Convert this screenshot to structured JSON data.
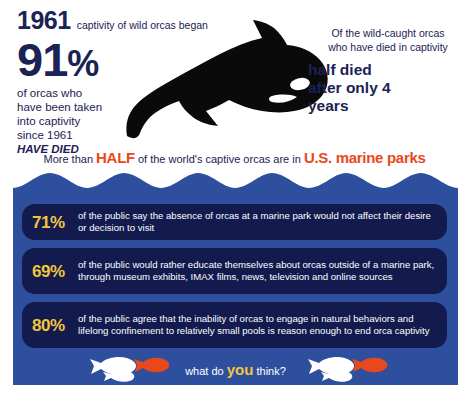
{
  "top": {
    "year": "1961",
    "year_caption": "captivity of wild orcas began",
    "percent_number": "91",
    "percent_symbol": "%",
    "body_line1": "of orcas who",
    "body_line2": "have been taken",
    "body_line3": "into captivity",
    "body_line4": "since 1961",
    "body_emphasis": "HAVE DIED",
    "right_lead_line1": "Of the wild-caught orcas",
    "right_lead_line2": "who have died in captivity",
    "right_big_line1": "half died",
    "right_big_line2": "after only 4",
    "right_big_line3": "years",
    "orca_icon": "orca-silhouette-icon"
  },
  "half_line": {
    "prefix": "More than ",
    "emphasis": "HALF",
    "middle": " of the world's captive orcas are in ",
    "emphasis2": "U.S. marine parks"
  },
  "panel": {
    "stats": [
      {
        "percent": "71%",
        "text": "of the public say the absence of orcas at a marine park would not affect their desire or decision to visit"
      },
      {
        "percent": "69%",
        "text": "of the public would rather educate themselves about orcas outside of a marine park, through museum exhibits, IMAX films, news, television and online sources"
      },
      {
        "percent": "80%",
        "text": "of the public agree that the inability of orcas to engage in natural behaviors and lifelong confinement to relatively small pools is reason enough to end orca captivity"
      }
    ],
    "footer": {
      "prefix": "what do ",
      "emphasis": "you",
      "suffix": " think?",
      "fish_icon": "fish-icon"
    }
  },
  "colors": {
    "navy_text": "#1b2254",
    "wave_blue": "#2d4f9e",
    "pill_navy": "#121a4e",
    "gold": "#f2c63c",
    "orange": "#e8491c",
    "white": "#ffffff",
    "orca_black": "#0a0a0a",
    "fish_orange": "#e8491c"
  }
}
